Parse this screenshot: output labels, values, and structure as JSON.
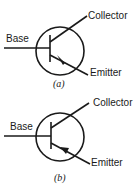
{
  "figures": [
    {
      "id": "a",
      "caption": "(a)",
      "labels": {
        "base": "Base",
        "collector": "Collector",
        "emitter": "Emitter"
      },
      "arrow_direction": "outward"
    },
    {
      "id": "b",
      "caption": "(b)",
      "labels": {
        "base": "Base",
        "collector": "Collector",
        "emitter": "Emitter"
      },
      "arrow_direction": "inward"
    }
  ],
  "colors": {
    "ink": "#1a1a1a",
    "background": "#ffffff"
  }
}
